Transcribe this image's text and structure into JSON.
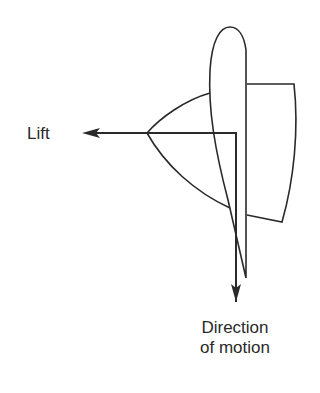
{
  "diagram": {
    "labels": {
      "lift": "Lift",
      "direction_line1": "Direction",
      "direction_line2": "of motion"
    },
    "elements": [
      {
        "name": "airfoil",
        "description": "elongated wing/fin cross-section, rounded leading edge at top, tapering to trailing edge at bottom"
      },
      {
        "name": "right-lobe",
        "description": "pressure region shape on the right of the airfoil"
      },
      {
        "name": "left-lobe",
        "description": "curved pressure region on the left, apex at lift arrow origin"
      },
      {
        "name": "lift-arrow",
        "direction": "left"
      },
      {
        "name": "motion-arrow",
        "direction": "down"
      }
    ],
    "colors": {
      "stroke": "#2a2a2a",
      "background": "#ffffff"
    }
  }
}
